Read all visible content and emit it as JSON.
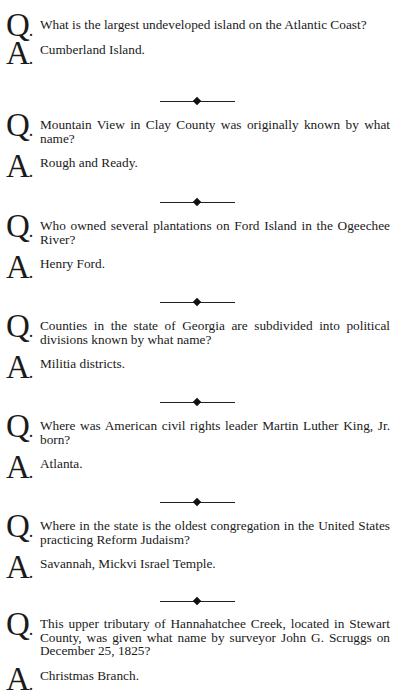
{
  "qa": [
    {
      "q_label": "Q",
      "question": "What is the largest undeveloped island on the Atlantic Coast?",
      "a_label": "A",
      "answer": "Cumberland Island."
    },
    {
      "q_label": "Q",
      "question": "Mountain View in Clay County was originally known by what name?",
      "a_label": "A",
      "answer": "Rough and Ready."
    },
    {
      "q_label": "Q",
      "question": "Who owned several plantations on Ford Island in the Ogeechee River?",
      "a_label": "A",
      "answer": "Henry Ford."
    },
    {
      "q_label": "Q",
      "question": "Counties in the state of Georgia are subdivided into political divisions known by what name?",
      "a_label": "A",
      "answer": "Militia districts."
    },
    {
      "q_label": "Q",
      "question": "Where was American civil rights leader Martin Luther King, Jr. born?",
      "a_label": "A",
      "answer": "Atlanta."
    },
    {
      "q_label": "Q",
      "question": "Where in the state is the oldest congregation in the United States practicing Reform Judaism?",
      "a_label": "A",
      "answer": "Savannah, Mickvi Israel Temple."
    },
    {
      "q_label": "Q",
      "question": "This upper tributary of Hannahatchee Creek, located in Stewart County, was given what name by surveyor John G. Scruggs on December 25, 1825?",
      "a_label": "A",
      "answer": "Christmas Branch."
    }
  ],
  "divider_glyph": "diamond-rule"
}
